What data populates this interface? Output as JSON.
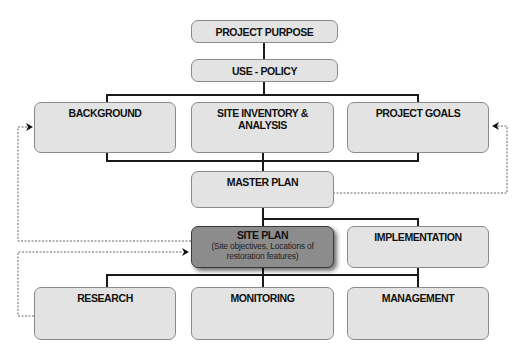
{
  "diagram": {
    "nodes": {
      "project_purpose": {
        "label": "PROJECT PURPOSE"
      },
      "use_policy": {
        "label": "USE - POLICY"
      },
      "background": {
        "label": "BACKGROUND"
      },
      "site_inventory": {
        "label": "SITE INVENTORY & ANALYSIS"
      },
      "project_goals": {
        "label": "PROJECT GOALS"
      },
      "master_plan": {
        "label": "MASTER PLAN"
      },
      "site_plan": {
        "label": "SITE PLAN",
        "sublabel": "(Site objectives, Locations of restoration features)"
      },
      "implementation": {
        "label": "IMPLEMENTATION"
      },
      "research": {
        "label": "RESEARCH"
      },
      "monitoring": {
        "label": "MONITORING"
      },
      "management": {
        "label": "MANAGEMENT"
      }
    },
    "edges": [
      {
        "from": "PROJECT PURPOSE",
        "to": "USE - POLICY",
        "style": "solid"
      },
      {
        "from": "USE - POLICY",
        "to": [
          "BACKGROUND",
          "SITE INVENTORY & ANALYSIS",
          "PROJECT GOALS"
        ],
        "style": "solid"
      },
      {
        "from": [
          "BACKGROUND",
          "SITE INVENTORY & ANALYSIS",
          "PROJECT GOALS"
        ],
        "to": "MASTER PLAN",
        "style": "solid"
      },
      {
        "from": "MASTER PLAN",
        "to": [
          "SITE PLAN",
          "IMPLEMENTATION"
        ],
        "style": "solid"
      },
      {
        "from": [
          "SITE PLAN",
          "IMPLEMENTATION"
        ],
        "to": [
          "RESEARCH",
          "MONITORING",
          "MANAGEMENT"
        ],
        "style": "solid"
      },
      {
        "from": "MASTER PLAN",
        "to": "PROJECT GOALS",
        "style": "dotted-feedback"
      },
      {
        "from": "SITE PLAN",
        "to": "BACKGROUND",
        "style": "dotted-feedback"
      },
      {
        "from": "RESEARCH",
        "to": "SITE PLAN",
        "style": "dotted-feedback"
      }
    ],
    "colors": {
      "box_fill": "#e3e3e3",
      "box_border": "#8a8a8a",
      "highlight_fill": "#8c8c8c",
      "connector": "#1a1a1a",
      "feedback": "#555555"
    }
  }
}
